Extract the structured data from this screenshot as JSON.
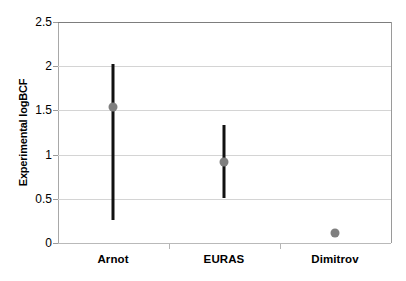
{
  "chart_data": {
    "type": "scatter",
    "title": "",
    "xlabel": "",
    "ylabel": "Experimental logBCF",
    "categories": [
      "Arnot",
      "EURAS",
      "Dimitrov"
    ],
    "ylim": [
      0,
      2.5
    ],
    "yticks": [
      0,
      0.5,
      1,
      1.5,
      2,
      2.5
    ],
    "ytick_labels": [
      "0",
      "0.5",
      "1",
      "1.5",
      "2",
      "2.5"
    ],
    "grid": true,
    "legend": "none",
    "series": [
      {
        "name": "Experimental logBCF",
        "marker_color": "#7f7f7f",
        "errorbar_color": "#111111",
        "points": [
          {
            "category": "Arnot",
            "value": 1.54,
            "low": 0.26,
            "high": 2.03,
            "has_errorbar": true
          },
          {
            "category": "EURAS",
            "value": 0.92,
            "low": 0.51,
            "high": 1.33,
            "has_errorbar": true
          },
          {
            "category": "Dimitrov",
            "value": 0.11,
            "low": null,
            "high": null,
            "has_errorbar": false
          }
        ]
      }
    ]
  },
  "axis": {
    "y_title": "Experimental logBCF",
    "tick_0": "0",
    "tick_1": "0.5",
    "tick_2": "1",
    "tick_3": "1.5",
    "tick_4": "2",
    "tick_5": "2.5"
  },
  "categories": {
    "cat_0": "Arnot",
    "cat_1": "EURAS",
    "cat_2": "Dimitrov"
  },
  "colors": {
    "marker": "#7f7f7f",
    "errorbar": "#111111",
    "gridline": "#d4d4d4",
    "axis": "#9a9a9a",
    "background": "#ffffff"
  }
}
